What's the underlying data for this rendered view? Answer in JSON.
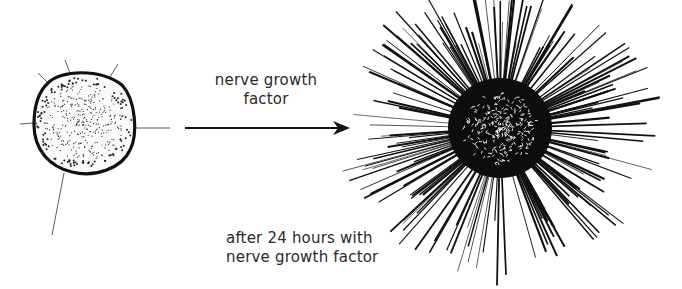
{
  "diagram": {
    "arrow_label": {
      "line1": "nerve growth",
      "line2": "factor"
    },
    "result_caption": {
      "line1": "after 24 hours with",
      "line2": "nerve growth factor"
    },
    "nodes": [
      {
        "id": "ganglion-before",
        "description": "small stippled ganglion with few short neurites"
      },
      {
        "id": "ganglion-after",
        "description": "dense ganglion with dense halo of radiating neurites"
      }
    ],
    "edges": [
      {
        "from": "ganglion-before",
        "to": "ganglion-after",
        "label": "nerve growth factor"
      }
    ],
    "colors": {
      "ink": "#111111",
      "text": "#2a2a2a",
      "background": "#ffffff"
    }
  }
}
